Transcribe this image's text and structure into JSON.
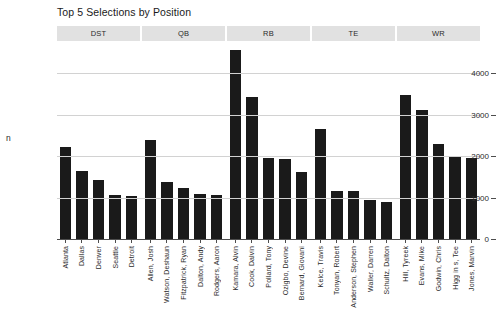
{
  "chart_data": {
    "type": "bar",
    "title": "Top 5 Selections by Position",
    "xlabel": "",
    "ylabel": "n",
    "ylim": [
      0,
      4700
    ],
    "grid": true,
    "legend": false,
    "yticks": [
      0,
      1000,
      2000,
      3000,
      4000
    ],
    "ytick_labels": [
      "0",
      "1000",
      "2000",
      "3000",
      "4000"
    ],
    "facet_variable": "Position",
    "facets": [
      {
        "label": "DST",
        "categories": [
          "Atlanta",
          "Dallas",
          "Denver",
          "Seattle",
          "Detroit"
        ],
        "values": [
          2210,
          1650,
          1430,
          1050,
          1030
        ]
      },
      {
        "label": "QB",
        "categories": [
          "Allen, Josh",
          "Watson, Deshaun",
          "Fitzpatrick, Ryan",
          "Dalton, Andy",
          "Rodgers, Aaron"
        ],
        "values": [
          2390,
          1370,
          1240,
          1090,
          1050
        ]
      },
      {
        "label": "RB",
        "categories": [
          "Kamara, Alvin",
          "Cook, Dalvin",
          "Pollard, Tony",
          "Ozigbo, Devine",
          "Bernard, Giovani"
        ],
        "values": [
          4560,
          3430,
          1960,
          1940,
          1620
        ]
      },
      {
        "label": "TE",
        "categories": [
          "Kelce, Travis",
          "Tonyan, Robert",
          "Anderson, Stephen",
          "Waller, Darren",
          "Schultz, Dalton"
        ],
        "values": [
          2650,
          1160,
          1150,
          950,
          900
        ]
      },
      {
        "label": "WR",
        "categories": [
          "Hill, Tyreek",
          "Evans, Mike",
          "Godwin, Chris",
          "Higg in s, Tee",
          "Jones, Marvin"
        ],
        "values": [
          3470,
          3120,
          2280,
          1980,
          1950
        ]
      }
    ],
    "colors": {
      "bar": "#1a1a1a",
      "gridline": "#d2d2d2",
      "strip_background": "#e1e1e1",
      "panel_background": "#ffffff",
      "text": "#2b2b2b"
    }
  }
}
